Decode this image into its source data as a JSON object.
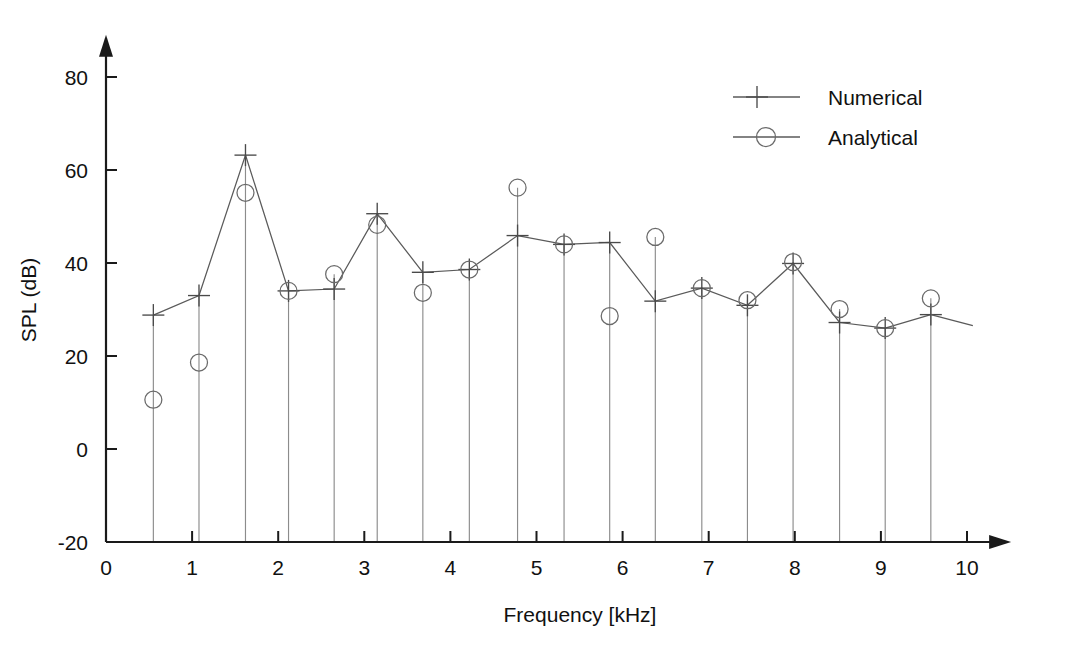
{
  "chart_data": {
    "type": "line",
    "title": "",
    "xlabel": "Frequency [kHz]",
    "ylabel": "SPL (dB)",
    "xlim": [
      0,
      10.35
    ],
    "ylim": [
      -20,
      85
    ],
    "xticks": [
      0,
      1,
      2,
      3,
      4,
      5,
      6,
      7,
      8,
      9,
      10
    ],
    "xticklabels": [
      "0",
      "1",
      "2",
      "3",
      "4",
      "5",
      "6",
      "7",
      "8",
      "9",
      "10"
    ],
    "yticks": [
      -20,
      0,
      20,
      40,
      60,
      80
    ],
    "yticklabels": [
      "-20",
      "0",
      "20",
      "40",
      "60",
      "80"
    ],
    "grid": false,
    "legend_position": "top-right",
    "stem_baseline": -20,
    "x": [
      0.55,
      1.08,
      1.62,
      2.12,
      2.65,
      3.15,
      3.68,
      4.22,
      4.78,
      5.32,
      5.85,
      6.38,
      6.92,
      7.45,
      7.98,
      8.52,
      9.05,
      9.58
    ],
    "series": [
      {
        "name": "Numerical",
        "marker": "plus",
        "values": [
          28.8,
          33.0,
          63.2,
          34.0,
          34.4,
          50.6,
          38.0,
          38.6,
          45.9,
          44.0,
          44.4,
          31.8,
          34.6,
          30.9,
          39.9,
          27.2,
          26.0,
          28.9
        ]
      },
      {
        "name": "Analytical",
        "marker": "circle",
        "values": [
          10.6,
          18.6,
          55.1,
          34.0,
          37.6,
          48.2,
          33.6,
          38.6,
          56.2,
          44.0,
          28.6,
          45.6,
          34.6,
          32.0,
          40.2,
          30.1,
          26.0,
          32.4
        ]
      }
    ]
  },
  "legend": {
    "entries": [
      {
        "label": "Numerical"
      },
      {
        "label": "Analytical"
      }
    ]
  },
  "axes": {
    "x_title": "Frequency [kHz]",
    "y_title": "SPL (dB)"
  },
  "colors": {
    "axis": "#1a1a1a",
    "stem": "#8c8c8c",
    "series": "#5a5a5a",
    "background": "#ffffff"
  }
}
